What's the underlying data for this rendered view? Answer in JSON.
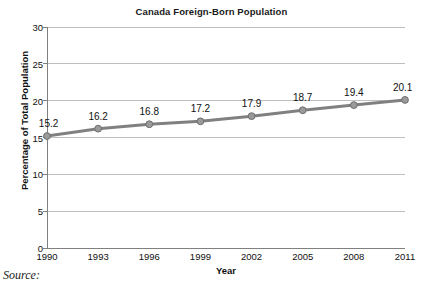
{
  "chart_data": {
    "type": "line",
    "title": "Canada Foreign-Born Population",
    "xlabel": "Year",
    "ylabel": "Percentage of Total Population",
    "categories": [
      "1990",
      "1993",
      "1996",
      "1999",
      "2002",
      "2005",
      "2008",
      "2011"
    ],
    "values": [
      15.2,
      16.2,
      16.8,
      17.2,
      17.9,
      18.7,
      19.4,
      20.1
    ],
    "point_labels": [
      "15.2",
      "16.2",
      "16.8",
      "17.2",
      "17.9",
      "18.7",
      "19.4",
      "20.1"
    ],
    "ylim": [
      0,
      30
    ],
    "yticks": [
      0,
      5,
      10,
      15,
      20,
      25,
      30
    ],
    "ytick_labels": [
      "0",
      "5",
      "10",
      "15",
      "20",
      "25",
      "30"
    ],
    "xtick_labels": [
      "1990",
      "1993",
      "1996",
      "1999",
      "2002",
      "2005",
      "2008",
      "2011"
    ],
    "grid": "horizontal",
    "legend": "none",
    "series_color": "#808080",
    "marker_color": "#9a9a9a",
    "marker_edge_color": "#6e6e6e",
    "grid_color": "#bfbfbf",
    "axis_color": "#808080",
    "text_color": "#111111"
  },
  "caption": {
    "source_label": "Source:"
  }
}
